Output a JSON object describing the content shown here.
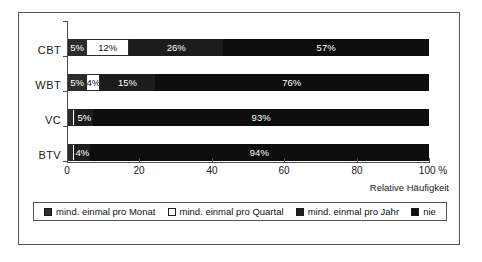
{
  "chart_data": {
    "type": "bar",
    "orientation": "horizontal",
    "stacked": true,
    "stacked_100": true,
    "title": "",
    "xlabel": "Relative Häufigkeit",
    "ylabel": "",
    "xlim": [
      0,
      100
    ],
    "xticks": [
      0,
      20,
      40,
      60,
      80,
      100
    ],
    "xtick_labels": [
      "0",
      "20",
      "40",
      "60",
      "80",
      "100 %"
    ],
    "grid": false,
    "legend_position": "bottom",
    "categories": [
      "CBT",
      "WBT",
      "VC",
      "BTV"
    ],
    "series": [
      {
        "name": "mind. einmal pro Monat",
        "color": "#2b2b2b",
        "values": [
          5,
          5,
          1,
          1
        ],
        "labels": [
          "5%",
          "5%",
          "",
          ""
        ]
      },
      {
        "name": "mind. einmal pro Quartal",
        "color": "#ffffff",
        "values": [
          12,
          4,
          1,
          1
        ],
        "labels": [
          "12%",
          "4%",
          "",
          ""
        ]
      },
      {
        "name": "mind. einmal pro Jahr",
        "color": "#1c1c1c",
        "values": [
          26,
          15,
          5,
          4
        ],
        "labels": [
          "26%",
          "15%",
          "5%",
          "4%"
        ]
      },
      {
        "name": "nie",
        "color": "#0d0d0d",
        "values": [
          57,
          76,
          93,
          94
        ],
        "labels": [
          "57%",
          "76%",
          "93%",
          "94%"
        ]
      }
    ]
  },
  "axis": {
    "x_title": "Relative Häufigkeit",
    "ticks": [
      {
        "value": 0,
        "label": "0"
      },
      {
        "value": 20,
        "label": "20"
      },
      {
        "value": 40,
        "label": "40"
      },
      {
        "value": 60,
        "label": "60"
      },
      {
        "value": 80,
        "label": "80"
      },
      {
        "value": 100,
        "label": "100 %"
      }
    ]
  },
  "categories": [
    {
      "label": "CBT"
    },
    {
      "label": "WBT"
    },
    {
      "label": "VC"
    },
    {
      "label": "BTV"
    }
  ],
  "bars": [
    {
      "category": "CBT",
      "segments": [
        {
          "series": "mind. einmal pro Monat",
          "value": 5,
          "label": "5%"
        },
        {
          "series": "mind. einmal pro Quartal",
          "value": 12,
          "label": "12%"
        },
        {
          "series": "mind. einmal pro Jahr",
          "value": 26,
          "label": "26%"
        },
        {
          "series": "nie",
          "value": 57,
          "label": "57%"
        }
      ]
    },
    {
      "category": "WBT",
      "segments": [
        {
          "series": "mind. einmal pro Monat",
          "value": 5,
          "label": "5%"
        },
        {
          "series": "mind. einmal pro Quartal",
          "value": 4,
          "label": "4%"
        },
        {
          "series": "mind. einmal pro Jahr",
          "value": 15,
          "label": "15%"
        },
        {
          "series": "nie",
          "value": 76,
          "label": "76%"
        }
      ]
    },
    {
      "category": "VC",
      "segments": [
        {
          "series": "mind. einmal pro Monat",
          "value": 1,
          "label": ""
        },
        {
          "series": "mind. einmal pro Quartal",
          "value": 1,
          "label": ""
        },
        {
          "series": "mind. einmal pro Jahr",
          "value": 5,
          "label": "5%"
        },
        {
          "series": "nie",
          "value": 93,
          "label": "93%"
        }
      ]
    },
    {
      "category": "BTV",
      "segments": [
        {
          "series": "mind. einmal pro Monat",
          "value": 1,
          "label": ""
        },
        {
          "series": "mind. einmal pro Quartal",
          "value": 1,
          "label": ""
        },
        {
          "series": "mind. einmal pro Jahr",
          "value": 4,
          "label": "4%"
        },
        {
          "series": "nie",
          "value": 94,
          "label": "94%"
        }
      ]
    }
  ],
  "legend": {
    "items": [
      {
        "label": "mind. einmal pro Monat",
        "color": "#2b2b2b"
      },
      {
        "label": "mind. einmal pro Quartal",
        "color": "#ffffff"
      },
      {
        "label": "mind. einmal pro Jahr",
        "color": "#1c1c1c"
      },
      {
        "label": "nie",
        "color": "#0d0d0d"
      }
    ]
  }
}
